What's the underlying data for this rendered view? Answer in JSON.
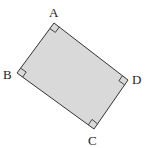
{
  "figure": {
    "shape": "rectangle",
    "fill_color": "#d9d9d9",
    "stroke_color": "#333333",
    "vertices": {
      "A": {
        "label": "A",
        "x": 54,
        "y": 23
      },
      "B": {
        "label": "B",
        "x": 17,
        "y": 73
      },
      "C": {
        "label": "C",
        "x": 94,
        "y": 129
      },
      "D": {
        "label": "D",
        "x": 128,
        "y": 80
      }
    },
    "right_angle_markers": [
      "A",
      "B",
      "C",
      "D"
    ]
  }
}
